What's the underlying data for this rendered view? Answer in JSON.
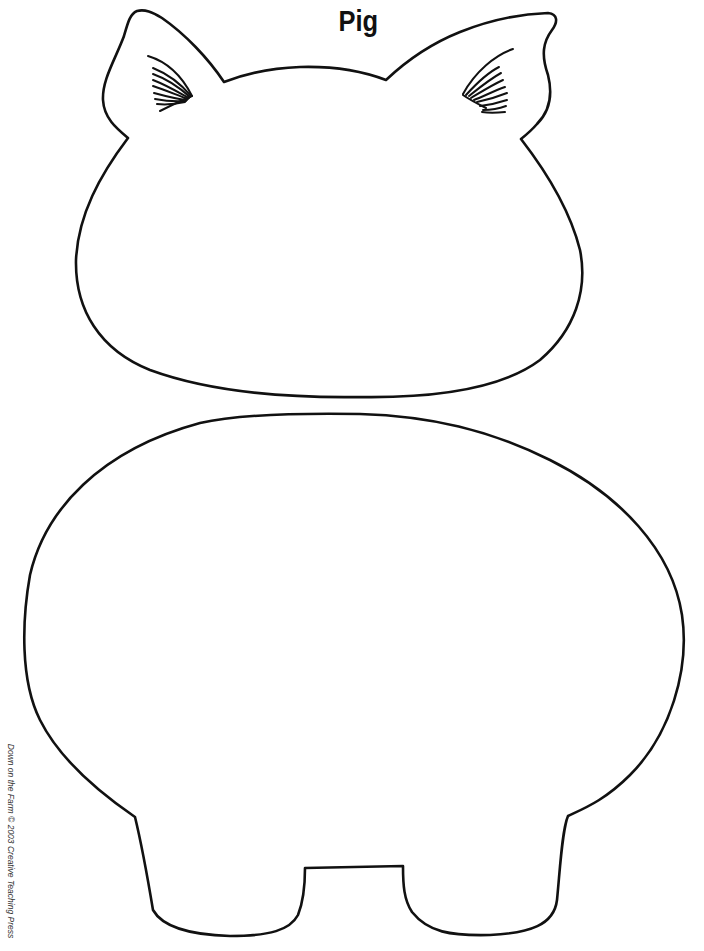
{
  "page": {
    "title": "Pig",
    "copyright": "Down on the Farm © 2003 Creative Teaching Press"
  },
  "illustration": {
    "subject": "pig-cutout-template",
    "parts": [
      "left-ear",
      "right-ear",
      "head",
      "body",
      "left-leg",
      "right-leg"
    ],
    "line_color": "#111111",
    "fill_color": "#ffffff"
  }
}
